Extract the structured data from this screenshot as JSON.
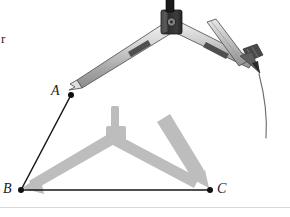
{
  "figure": {
    "background_color": "#ffffff",
    "width": 290,
    "height": 217,
    "stray_text": "r",
    "bottom_rule_color": "#d8d8d8"
  },
  "labels": {
    "vertex_a": "A",
    "vertex_b": "B",
    "vertex_c": "C"
  },
  "points": {
    "a": {
      "x": 71,
      "y": 95,
      "label": "A"
    },
    "b": {
      "x": 21,
      "y": 190,
      "label": "B"
    },
    "c": {
      "x": 210,
      "y": 190,
      "label": "C"
    }
  },
  "segments": [
    {
      "name": "segment-ab",
      "from": "a",
      "to": "b",
      "color": "#161616",
      "width": 1.4
    },
    {
      "name": "segment-bc",
      "from": "b",
      "to": "c",
      "color": "#161616",
      "width": 1.4
    }
  ],
  "arc": {
    "name": "construction-arc",
    "color": "#555555",
    "width": 1.0,
    "description": "arc being drawn by pencil tip"
  },
  "compass_active": {
    "name": "compass-active",
    "hinge": {
      "x": 171,
      "y": 22
    },
    "needle_tip": {
      "x": 72,
      "y": 94
    },
    "pencil_tip": {
      "x": 262,
      "y": 69
    },
    "body_color": "#3a3a3a",
    "leg_color": "#c9c9c9",
    "leg_outline": "#4a4a4a",
    "handle_color": "#1c1c1c"
  },
  "compass_ghost": {
    "name": "compass-ghost",
    "hinge": {
      "x": 116,
      "y": 136
    },
    "needle_tip": {
      "x": 23,
      "y": 188
    },
    "pencil_tip": {
      "x": 208,
      "y": 188
    },
    "color": "#bdbdbd"
  },
  "colors": {
    "ink": "#161616",
    "compass_dark": "#3a3a3a",
    "compass_light": "#c9c9c9",
    "ghost": "#bdbdbd",
    "arc": "#555555"
  }
}
